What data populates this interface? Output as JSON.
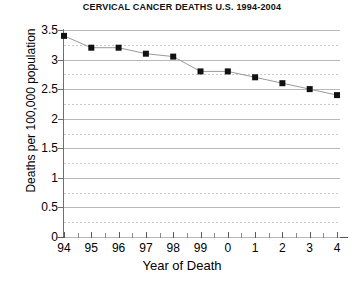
{
  "chart_data": {
    "type": "line",
    "title": "CERVICAL CANCER DEATHS U.S. 1994-2004",
    "xlabel": "Year of Death",
    "ylabel": "Deaths per 100,000 population",
    "categories": [
      "94",
      "95",
      "96",
      "97",
      "98",
      "99",
      "0",
      "1",
      "2",
      "3",
      "4"
    ],
    "values": [
      3.4,
      3.2,
      3.2,
      3.1,
      3.05,
      2.8,
      2.8,
      2.7,
      2.6,
      2.5,
      2.4
    ],
    "x_tick_labels": [
      "94",
      "95",
      "96",
      "97",
      "98",
      "99",
      "0",
      "1",
      "2",
      "3",
      "4"
    ],
    "y_tick_labels": [
      "0",
      "0.5",
      "1",
      "1.5",
      "2",
      "2.5",
      "3",
      "3.5"
    ],
    "y_tick_values": [
      0,
      0.5,
      1,
      1.5,
      2,
      2.5,
      3,
      3.5
    ],
    "ylim": [
      0,
      3.5
    ],
    "xlim": [
      0,
      10
    ],
    "grid": "horizontal major solid and minor dotted",
    "legend": "none",
    "marker": "filled square",
    "line_color": "#9a9a9a",
    "marker_color": "#111111",
    "background_color": "#ffffff"
  }
}
